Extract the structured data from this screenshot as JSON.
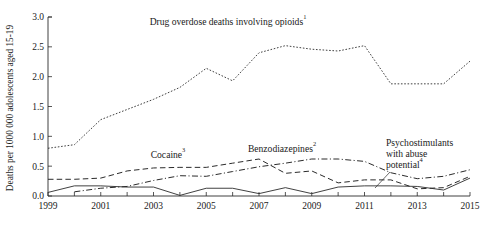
{
  "figure": {
    "ylabel": "Deaths per 1000 000 adolescents aged 15-19",
    "footnote": "",
    "axis_color": "#2b2b2b"
  },
  "annotations": {
    "opioids": {
      "text": "Drug overdose deaths involving opioids",
      "sup": "1",
      "x": 228,
      "y": 25
    },
    "cocaine": {
      "text": "Cocaine",
      "sup": "3",
      "x": 168,
      "y": 158
    },
    "benzodiazepines": {
      "text": "Benzodiazepines",
      "sup": "2",
      "x": 282,
      "y": 152
    },
    "psychostimulants_line1": {
      "text": "Psychostimulants",
      "x": 386,
      "y": 146
    },
    "psychostimulants_line2": {
      "text": "with abuse",
      "x": 386,
      "y": 157
    },
    "psychostimulants_line3": {
      "text": "potential",
      "sup": "4",
      "x": 386,
      "y": 168
    }
  },
  "chart_data": {
    "type": "line",
    "title": "",
    "xlabel": "",
    "ylabel": "Deaths per 1000 000 adolescents aged 15-19",
    "xlim": [
      1999,
      2015
    ],
    "ylim": [
      0.0,
      3.0
    ],
    "grid": false,
    "legend_position": "inline-annotations",
    "x": [
      1999,
      2000,
      2001,
      2002,
      2003,
      2004,
      2005,
      2006,
      2007,
      2008,
      2009,
      2010,
      2011,
      2012,
      2013,
      2014,
      2015
    ],
    "ytick_labels": [
      "0.0",
      "0.5",
      "1.0",
      "1.5",
      "2.0",
      "2.5",
      "3.0"
    ],
    "ytick_values": [
      0.0,
      0.5,
      1.0,
      1.5,
      2.0,
      2.5,
      3.0
    ],
    "xtick_labels": [
      "1999",
      "2001",
      "2003",
      "2005",
      "2007",
      "2009",
      "2011",
      "2013",
      "2015"
    ],
    "xtick_values": [
      1999,
      2001,
      2003,
      2005,
      2007,
      2009,
      2011,
      2013,
      2015
    ],
    "series": [
      {
        "name": "Drug overdose deaths involving opioids",
        "footnote_marker": "1",
        "style": "dotted",
        "values": [
          0.8,
          0.86,
          1.28,
          1.45,
          1.62,
          1.82,
          2.14,
          1.93,
          2.4,
          2.52,
          2.46,
          2.43,
          2.52,
          1.88,
          1.88,
          1.88,
          2.26
        ]
      },
      {
        "name": "Cocaine",
        "footnote_marker": "3",
        "style": "dashed",
        "values": [
          0.28,
          0.28,
          0.3,
          0.42,
          0.47,
          0.48,
          0.48,
          0.55,
          0.62,
          0.38,
          0.42,
          0.22,
          0.27,
          0.27,
          0.12,
          0.14,
          0.33
        ]
      },
      {
        "name": "Benzodiazepines",
        "footnote_marker": "2",
        "style": "dash-dot",
        "values": [
          null,
          0.07,
          0.13,
          0.16,
          0.26,
          0.34,
          0.33,
          0.41,
          0.49,
          0.55,
          0.62,
          0.62,
          0.58,
          0.39,
          0.29,
          0.33,
          0.44
        ]
      },
      {
        "name": "Psychostimulants with abuse potential",
        "footnote_marker": "4",
        "style": "solid",
        "values": [
          0.06,
          0.17,
          0.17,
          0.15,
          0.15,
          0.01,
          0.13,
          0.13,
          0.04,
          0.14,
          0.04,
          0.15,
          0.17,
          0.17,
          0.16,
          0.1,
          0.3
        ]
      }
    ]
  }
}
